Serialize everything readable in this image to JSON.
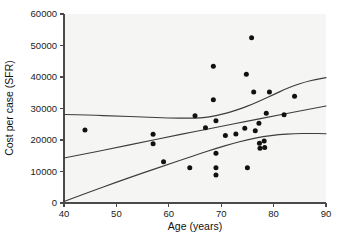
{
  "chart_data": {
    "type": "scatter",
    "title": "",
    "xlabel": "Age (years)",
    "ylabel": "Cost per case (SFR)",
    "xlim": [
      40,
      90
    ],
    "ylim": [
      0,
      60000
    ],
    "xticks": [
      40,
      50,
      60,
      70,
      80,
      90
    ],
    "yticks": [
      0,
      10000,
      20000,
      30000,
      40000,
      50000,
      60000
    ],
    "xtick_labels": [
      "40",
      "50",
      "60",
      "70",
      "80",
      "90"
    ],
    "ytick_labels": [
      "0",
      "10000",
      "20000",
      "30000",
      "40000",
      "50000",
      "60000"
    ],
    "grid": false,
    "legend": null,
    "legend_position": "none",
    "point_color": "#111111",
    "curve_color": "#3d3d3d",
    "background_color": "#f5f5f3",
    "points": [
      {
        "x": 44.0,
        "y": 23200
      },
      {
        "x": 57.0,
        "y": 21800
      },
      {
        "x": 57.0,
        "y": 18800
      },
      {
        "x": 59.0,
        "y": 13100
      },
      {
        "x": 64.0,
        "y": 11200
      },
      {
        "x": 65.0,
        "y": 27700
      },
      {
        "x": 67.0,
        "y": 23900
      },
      {
        "x": 68.5,
        "y": 43400
      },
      {
        "x": 68.5,
        "y": 32800
      },
      {
        "x": 69.0,
        "y": 26100
      },
      {
        "x": 69.0,
        "y": 15800
      },
      {
        "x": 69.0,
        "y": 11200
      },
      {
        "x": 69.0,
        "y": 8900
      },
      {
        "x": 70.8,
        "y": 21400
      },
      {
        "x": 72.8,
        "y": 21900
      },
      {
        "x": 74.8,
        "y": 40900
      },
      {
        "x": 74.5,
        "y": 23700
      },
      {
        "x": 75.0,
        "y": 11200
      },
      {
        "x": 75.8,
        "y": 52500
      },
      {
        "x": 76.2,
        "y": 35200
      },
      {
        "x": 76.5,
        "y": 22900
      },
      {
        "x": 77.2,
        "y": 25300
      },
      {
        "x": 77.3,
        "y": 19000
      },
      {
        "x": 77.4,
        "y": 17400
      },
      {
        "x": 78.2,
        "y": 19700
      },
      {
        "x": 78.3,
        "y": 17600
      },
      {
        "x": 78.6,
        "y": 28500
      },
      {
        "x": 79.2,
        "y": 35200
      },
      {
        "x": 82.0,
        "y": 28000
      },
      {
        "x": 84.0,
        "y": 33900
      }
    ],
    "curves": [
      {
        "name": "upper-curve",
        "points": [
          {
            "x": 40,
            "y": 28100
          },
          {
            "x": 45,
            "y": 27900
          },
          {
            "x": 50,
            "y": 27600
          },
          {
            "x": 55,
            "y": 27300
          },
          {
            "x": 60,
            "y": 27000
          },
          {
            "x": 64,
            "y": 26900
          },
          {
            "x": 66,
            "y": 27000
          },
          {
            "x": 68,
            "y": 27400
          },
          {
            "x": 70,
            "y": 28100
          },
          {
            "x": 72,
            "y": 29000
          },
          {
            "x": 74,
            "y": 30100
          },
          {
            "x": 76,
            "y": 31400
          },
          {
            "x": 78,
            "y": 32900
          },
          {
            "x": 80,
            "y": 34400
          },
          {
            "x": 82,
            "y": 36000
          },
          {
            "x": 84,
            "y": 37300
          },
          {
            "x": 86,
            "y": 38400
          },
          {
            "x": 88,
            "y": 39200
          },
          {
            "x": 90,
            "y": 39800
          }
        ]
      },
      {
        "name": "middle-curve",
        "points": [
          {
            "x": 40,
            "y": 14300
          },
          {
            "x": 45,
            "y": 15900
          },
          {
            "x": 50,
            "y": 17600
          },
          {
            "x": 55,
            "y": 19300
          },
          {
            "x": 60,
            "y": 21000
          },
          {
            "x": 65,
            "y": 22700
          },
          {
            "x": 70,
            "y": 24300
          },
          {
            "x": 75,
            "y": 26000
          },
          {
            "x": 80,
            "y": 27600
          },
          {
            "x": 85,
            "y": 29200
          },
          {
            "x": 90,
            "y": 30800
          }
        ]
      },
      {
        "name": "lower-curve",
        "points": [
          {
            "x": 40,
            "y": 500
          },
          {
            "x": 45,
            "y": 3600
          },
          {
            "x": 50,
            "y": 6600
          },
          {
            "x": 55,
            "y": 9500
          },
          {
            "x": 60,
            "y": 12300
          },
          {
            "x": 63,
            "y": 14000
          },
          {
            "x": 66,
            "y": 15700
          },
          {
            "x": 69,
            "y": 17300
          },
          {
            "x": 72,
            "y": 18800
          },
          {
            "x": 75,
            "y": 20100
          },
          {
            "x": 78,
            "y": 21100
          },
          {
            "x": 81,
            "y": 21700
          },
          {
            "x": 84,
            "y": 22000
          },
          {
            "x": 87,
            "y": 22100
          },
          {
            "x": 90,
            "y": 22000
          }
        ]
      }
    ]
  }
}
